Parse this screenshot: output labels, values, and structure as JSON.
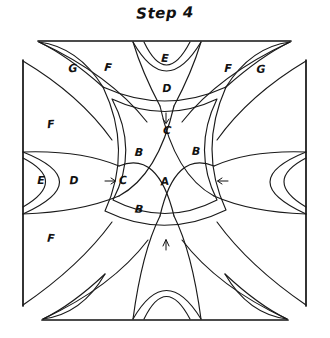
{
  "title": "Step 4",
  "colors": {
    "ink": "#111111",
    "line": "#1a1a1a",
    "background": "#ffffff"
  },
  "diagram": {
    "kind": "hand-drawn-geometric-construction",
    "frame": {
      "shape": "octagon-clipped-square",
      "corners_cut": true,
      "top_edge": {
        "x1": 38,
        "y1": 41,
        "x2": 291,
        "y2": 41
      },
      "bottom_edge": {
        "x1": 42,
        "y1": 320,
        "x2": 288,
        "y2": 320
      },
      "left_edge": {
        "x1": 23,
        "y1": 60,
        "x2": 23,
        "y2": 306
      },
      "right_edge": {
        "x1": 306,
        "y1": 60,
        "x2": 306,
        "y2": 306
      }
    },
    "labels": [
      {
        "text": "G",
        "x": 73,
        "y": 69,
        "region": "top-left-sliver"
      },
      {
        "text": "F",
        "x": 108,
        "y": 68,
        "region": "top-left-panel"
      },
      {
        "text": "E",
        "x": 165,
        "y": 59,
        "region": "top-center-outer"
      },
      {
        "text": "F",
        "x": 228,
        "y": 69,
        "region": "top-right-panel"
      },
      {
        "text": "G",
        "x": 261,
        "y": 70,
        "region": "top-right-sliver"
      },
      {
        "text": "D",
        "x": 167,
        "y": 89,
        "region": "top-center-inner"
      },
      {
        "text": "F",
        "x": 51,
        "y": 125,
        "region": "left-upper-panel"
      },
      {
        "text": "C",
        "x": 167,
        "y": 131,
        "region": "top-band-tip"
      },
      {
        "text": "B",
        "x": 139,
        "y": 153,
        "region": "center-upper-left"
      },
      {
        "text": "B",
        "x": 196,
        "y": 152,
        "region": "center-upper-right"
      },
      {
        "text": "E",
        "x": 41,
        "y": 181,
        "region": "left-outer-lens"
      },
      {
        "text": "D",
        "x": 74,
        "y": 181,
        "region": "left-inner-lens"
      },
      {
        "text": "C",
        "x": 123,
        "y": 181,
        "region": "left-band-tip"
      },
      {
        "text": "A",
        "x": 165,
        "y": 182,
        "region": "center"
      },
      {
        "text": "B",
        "x": 139,
        "y": 210,
        "region": "center-lower-left"
      },
      {
        "text": "F",
        "x": 51,
        "y": 239,
        "region": "left-lower-panel"
      }
    ],
    "arrows": [
      {
        "name": "arrow-down",
        "direction": "down",
        "x": 166,
        "y": 119
      },
      {
        "name": "arrow-right",
        "direction": "right",
        "x": 111,
        "y": 181
      },
      {
        "name": "arrow-left",
        "direction": "left",
        "x": 222,
        "y": 181
      },
      {
        "name": "arrow-up",
        "direction": "up",
        "x": 166,
        "y": 244
      }
    ]
  }
}
